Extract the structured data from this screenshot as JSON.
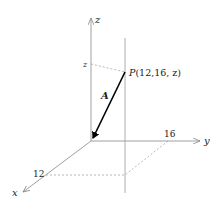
{
  "diagram": {
    "type": "3d-coordinate-vector",
    "axes": {
      "x_label": "x",
      "y_label": "y",
      "z_label": "z"
    },
    "ticks": {
      "x_tick": "12",
      "y_tick": "16",
      "z_tick": "z"
    },
    "point": {
      "name": "P",
      "coords": "(12,16, z)"
    },
    "vector": {
      "label": "A"
    },
    "colors": {
      "axis": "#888888",
      "dashed": "#999999",
      "vector": "#000000",
      "text": "#222222"
    }
  }
}
